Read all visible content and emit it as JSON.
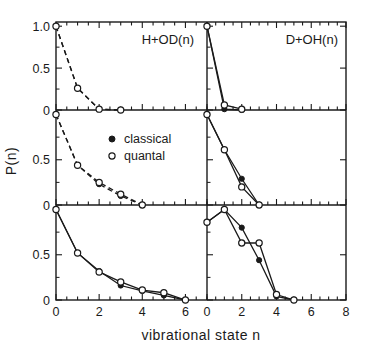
{
  "figure": {
    "xlabel": "vibrational  state  n",
    "ylabel": "P(n)",
    "legend": {
      "classical_label": "classical",
      "quantal_label": "quantal",
      "classical_marker": "filled-circle",
      "quantal_marker": "open-circle"
    },
    "colors": {
      "ink": "#1a1a1a",
      "background": "#ffffff"
    }
  },
  "columns": [
    {
      "title": "H+OD(n)",
      "xmin": 0,
      "xmax": 7,
      "xticks": [
        0,
        2,
        4,
        6
      ],
      "xtick_step": 0.5
    },
    {
      "title": "D+OH(n)",
      "xmin": 0,
      "xmax": 8,
      "xticks": [
        0,
        2,
        4,
        6,
        8
      ],
      "xtick_step": 0.5
    }
  ],
  "yaxis": {
    "ylim": [
      0,
      1.05
    ],
    "ticks_top": [
      "1.0",
      "0.5",
      "0"
    ],
    "ticks_mid": [
      "0.5",
      "0"
    ],
    "ticks_bottom": [
      "0.5",
      "0"
    ],
    "tick_values_top": [
      1.0,
      0.5,
      0.0
    ],
    "tick_values_other": [
      0.5,
      0.0
    ]
  },
  "chart_data": {
    "type": "line",
    "title": "",
    "xlabel": "vibrational  state  n",
    "ylabel": "P(n)",
    "grid": false,
    "legend_position": "center-left-panel",
    "legend_entries": [
      "classical",
      "quantal"
    ],
    "panel_layout": {
      "rows": 3,
      "cols": 2
    },
    "panels": [
      {
        "row": 0,
        "col": 0,
        "title": "H+OD(n)",
        "xlim": [
          0,
          7
        ],
        "ylim": [
          0,
          1.05
        ],
        "linestyle": "dashed",
        "series": [
          {
            "name": "classical",
            "marker": "filled-circle",
            "x": [
              0,
              1,
              2,
              3
            ],
            "values": [
              1.0,
              0.26,
              0.01,
              0.0
            ]
          },
          {
            "name": "quantal",
            "marker": "open-circle",
            "x": [
              0,
              1,
              2,
              3
            ],
            "values": [
              1.0,
              0.26,
              0.01,
              0.0
            ]
          }
        ]
      },
      {
        "row": 0,
        "col": 1,
        "title": "D+OH(n)",
        "xlim": [
          0,
          8
        ],
        "ylim": [
          0,
          1.05
        ],
        "linestyle": "solid",
        "series": [
          {
            "name": "classical",
            "marker": "filled-circle",
            "x": [
              0,
              1,
              2
            ],
            "values": [
              1.0,
              0.01,
              0.0
            ]
          },
          {
            "name": "quantal",
            "marker": "open-circle",
            "x": [
              0,
              1,
              2
            ],
            "values": [
              1.0,
              0.06,
              0.01
            ]
          }
        ]
      },
      {
        "row": 1,
        "col": 0,
        "title": "",
        "xlim": [
          0,
          7
        ],
        "ylim": [
          0,
          1.05
        ],
        "linestyle": "dashed",
        "series": [
          {
            "name": "classical",
            "marker": "filled-circle",
            "x": [
              0,
              1,
              2,
              3,
              4
            ],
            "values": [
              1.0,
              0.44,
              0.23,
              0.1,
              0.0
            ]
          },
          {
            "name": "quantal",
            "marker": "open-circle",
            "x": [
              0,
              1,
              2,
              3,
              4
            ],
            "values": [
              1.0,
              0.44,
              0.25,
              0.12,
              0.0
            ]
          }
        ]
      },
      {
        "row": 1,
        "col": 1,
        "title": "",
        "xlim": [
          0,
          8
        ],
        "ylim": [
          0,
          1.05
        ],
        "linestyle": "solid",
        "series": [
          {
            "name": "classical",
            "marker": "filled-circle",
            "x": [
              0,
              1,
              2,
              3
            ],
            "values": [
              1.0,
              0.61,
              0.29,
              0.0
            ]
          },
          {
            "name": "quantal",
            "marker": "open-circle",
            "x": [
              0,
              1,
              2,
              3
            ],
            "values": [
              1.0,
              0.61,
              0.2,
              0.0
            ]
          }
        ]
      },
      {
        "row": 2,
        "col": 0,
        "title": "",
        "xlim": [
          0,
          7
        ],
        "ylim": [
          0,
          1.05
        ],
        "linestyle": "solid",
        "series": [
          {
            "name": "classical",
            "marker": "filled-circle",
            "x": [
              0,
              1,
              2,
              3,
              4,
              5,
              6
            ],
            "values": [
              1.0,
              0.52,
              0.32,
              0.16,
              0.1,
              0.05,
              0.0
            ]
          },
          {
            "name": "quantal",
            "marker": "open-circle",
            "x": [
              0,
              1,
              2,
              3,
              4,
              5,
              6
            ],
            "values": [
              1.0,
              0.52,
              0.31,
              0.2,
              0.11,
              0.08,
              0.0
            ]
          }
        ]
      },
      {
        "row": 2,
        "col": 1,
        "title": "",
        "xlim": [
          0,
          8
        ],
        "ylim": [
          0,
          1.05
        ],
        "linestyle": "solid",
        "series": [
          {
            "name": "classical",
            "marker": "filled-circle",
            "x": [
              0,
              1,
              2,
              3,
              4,
              5
            ],
            "values": [
              0.86,
              1.0,
              0.8,
              0.44,
              0.04,
              0.0
            ]
          },
          {
            "name": "quantal",
            "marker": "open-circle",
            "x": [
              0,
              1,
              2,
              3,
              4,
              5
            ],
            "values": [
              0.86,
              1.0,
              0.63,
              0.63,
              0.06,
              0.0
            ]
          }
        ]
      }
    ]
  }
}
